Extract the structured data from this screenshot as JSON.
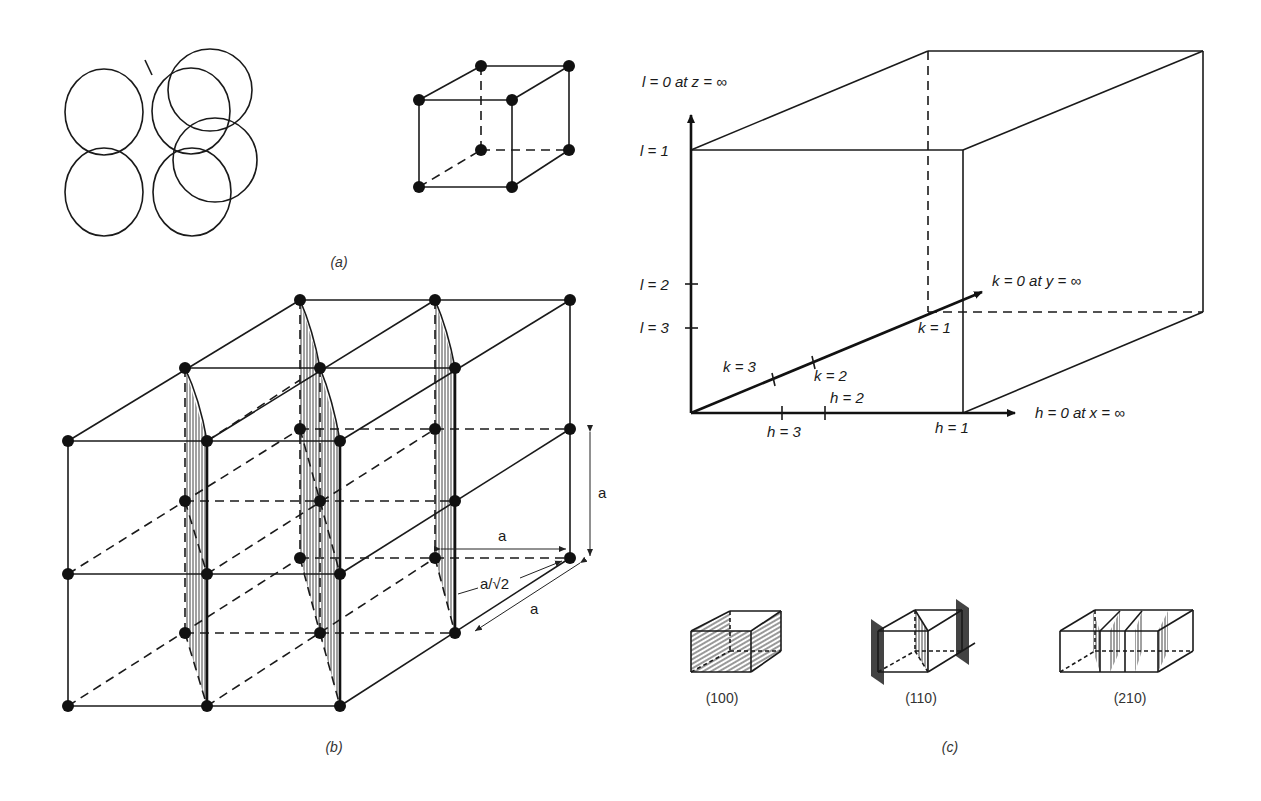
{
  "figure": {
    "panels": [
      {
        "id": "a",
        "caption": "(a)",
        "description": "Close-packed spheres and simple cubic unit cell"
      },
      {
        "id": "b",
        "caption": "(b)",
        "description": "Simple cubic lattice with (110) planes shaded"
      },
      {
        "id": "c",
        "caption": "(c)",
        "description": "Miller index intercept construction"
      }
    ]
  },
  "panel_b": {
    "dim_vertical": "a",
    "dim_horizontal": "a",
    "dim_spacing": "a/√2",
    "dim_depth": "a"
  },
  "panel_c": {
    "z_axis_label": "l = 0 at z = ∞",
    "y_axis_label": "k = 0 at y = ∞",
    "x_axis_label": "h = 0 at x = ∞",
    "l_ticks": [
      "l = 1",
      "l = 2",
      "l = 3"
    ],
    "k_ticks": [
      "k = 1",
      "k = 2",
      "k = 3"
    ],
    "h_ticks": [
      "h = 1",
      "h = 2",
      "h = 3"
    ],
    "planes": [
      {
        "label": "(100)"
      },
      {
        "label": "(110)"
      },
      {
        "label": "(210)"
      }
    ]
  }
}
